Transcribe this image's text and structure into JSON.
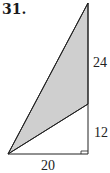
{
  "problem": {
    "number": "31."
  },
  "figure": {
    "labels": {
      "upper_right_side": "24",
      "lower_right_side": "12",
      "bottom_side": "20"
    },
    "colors": {
      "shade": "#cfcfcf",
      "stroke": "#222222"
    },
    "right_angle_marker": true
  }
}
